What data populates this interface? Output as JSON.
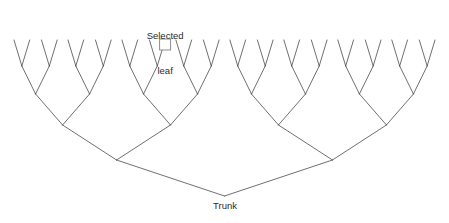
{
  "diagram": {
    "type": "binary-tree",
    "title": "",
    "background_color": "#ffffff",
    "line_color": "#4a4a4a",
    "line_width": 0.8,
    "marker_color": "#808080",
    "text_color": "#2b2b2b",
    "labels": {
      "selected_leaf": "Selected\nleaf",
      "selected_leaf_line1": "Selected",
      "selected_leaf_line2": "leaf",
      "trunk": "Trunk"
    },
    "marker": {
      "name": "selected-leaf-marker",
      "shape": "square",
      "x": 191,
      "y": 44.5,
      "size": 11
    },
    "geometry": {
      "root": {
        "x": 225,
        "y": 196
      },
      "leaf_y": 40,
      "level_y": [
        40,
        66,
        94,
        125,
        160,
        196
      ],
      "leaf_count": 32,
      "leaf_x": [
        14,
        30,
        48,
        64,
        84,
        100,
        118,
        134,
        154,
        170,
        188,
        204,
        224,
        240,
        258,
        274,
        175,
        191,
        209,
        225,
        245,
        261,
        279,
        295,
        315,
        331,
        349,
        365,
        385,
        401,
        419,
        435
      ],
      "leaves": [
        14,
        30,
        48,
        64,
        84,
        100,
        118,
        134,
        154,
        170,
        188,
        204,
        224,
        240,
        258,
        274
      ],
      "selected_leaf_index": 11,
      "selected_leaf_x": 191,
      "left_subtree_root": {
        "x": 115,
        "y": 160
      },
      "right_subtree_root": {
        "x": 335,
        "y": 160
      }
    }
  }
}
